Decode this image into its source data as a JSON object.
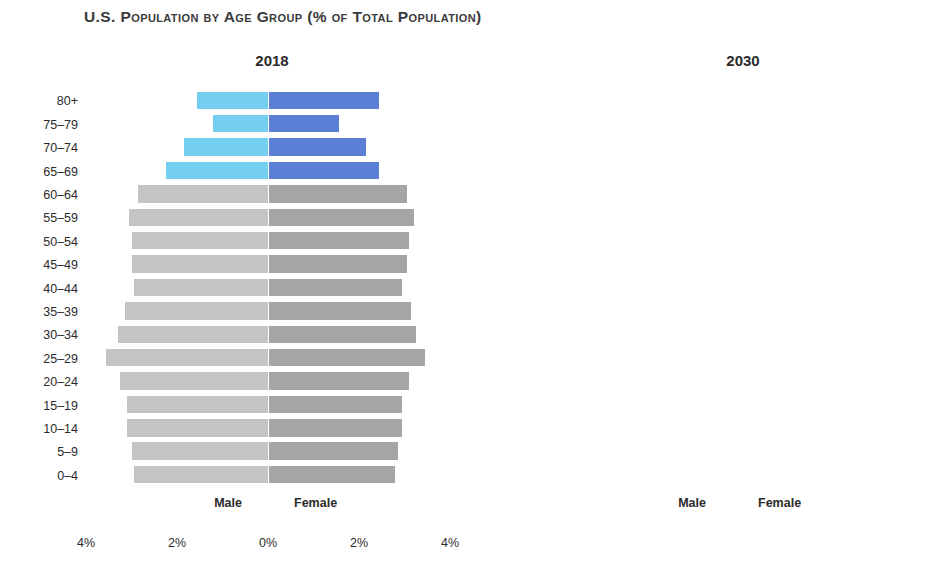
{
  "title": "U.S. Population by Age Group (% of Total Population)",
  "sex_labels": {
    "male": "Male",
    "female": "Female"
  },
  "colors": {
    "male_default": "#c3c4c6",
    "female_default": "#a4a5a7",
    "male_highlight": "#74cef0",
    "female_highlight": "#5b7fd4",
    "background": "#ffffff",
    "text": "#2b2b2b"
  },
  "panels": [
    {
      "id": "2018",
      "year": "2018"
    },
    {
      "id": "2030",
      "year": "2030"
    }
  ],
  "xaxis": {
    "ticks": [
      "4%",
      "2%",
      "0%",
      "2%",
      "4%"
    ],
    "min": -4,
    "max": 4
  },
  "chart_data": {
    "type": "bar",
    "subtype": "population-pyramid",
    "title": "U.S. Population by Age Group (% of Total Population)",
    "xlabel": "",
    "ylabel": "",
    "xlim": [
      -4,
      4
    ],
    "grid": false,
    "legend": [
      "Male",
      "Female"
    ],
    "legend_position": "bottom-inline",
    "units": "percent of total population",
    "highlighted_age_groups": [
      "65–69",
      "70–74",
      "75–79",
      "80+"
    ],
    "categories": [
      "80+",
      "75–79",
      "70–74",
      "65–69",
      "60–64",
      "55–59",
      "50–54",
      "45–49",
      "40–44",
      "35–39",
      "30–34",
      "25–29",
      "20–24",
      "15–19",
      "10–14",
      "5–9",
      "0–4"
    ],
    "panels": [
      {
        "year": "2018",
        "series": [
          {
            "name": "Male",
            "values": [
              1.55,
              1.2,
              1.85,
              2.25,
              2.85,
              3.05,
              3.0,
              3.0,
              2.95,
              3.15,
              3.3,
              3.55,
              3.25,
              3.1,
              3.1,
              3.0,
              2.95
            ]
          },
          {
            "name": "Female",
            "values": [
              2.45,
              1.55,
              2.15,
              2.45,
              3.05,
              3.2,
              3.1,
              3.05,
              2.95,
              3.15,
              3.25,
              3.45,
              3.1,
              2.95,
              2.95,
              2.85,
              2.8
            ]
          }
        ]
      },
      {
        "year": "2030",
        "series": [
          {
            "name": "Male",
            "values": [
              2.15,
              1.85,
              2.5,
              2.75,
              2.7,
              2.65,
              2.55,
              2.9,
              3.05,
              3.3,
              3.1,
              3.1,
              2.95,
              3.0,
              3.0,
              2.9,
              2.9
            ]
          },
          {
            "name": "Female",
            "values": [
              3.3,
              2.25,
              2.85,
              2.95,
              2.85,
              2.8,
              2.7,
              2.95,
              3.05,
              3.2,
              3.0,
              2.95,
              2.8,
              2.85,
              2.8,
              2.75,
              2.7
            ]
          }
        ]
      }
    ]
  }
}
